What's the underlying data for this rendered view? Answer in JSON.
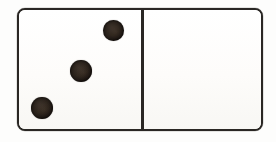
{
  "scene": {
    "width": 276,
    "height": 142,
    "background_color": "#fdfdfc",
    "subject": "domino-tile"
  },
  "domino": {
    "label": "domino tile",
    "outline_color": "#2a2724",
    "face_color": "#fefefd",
    "pip_color": "#1a1410",
    "border_width_px": 2.4,
    "corner_radius_px": 8,
    "bounds": {
      "x": 17,
      "y": 8,
      "width": 246,
      "height": 123
    },
    "divider": {
      "label": "center divider line",
      "x": 143,
      "width_px": 2.4,
      "color": "#2a2724"
    },
    "total_pips": 3,
    "notation": "3-0",
    "halves": [
      {
        "name": "left-half",
        "pip_count": 3,
        "pips": [
          {
            "name": "pip-top-right",
            "cx": 113.5,
            "cy": 30.5,
            "d": 21
          },
          {
            "name": "pip-middle",
            "cx": 81.0,
            "cy": 71.0,
            "d": 22
          },
          {
            "name": "pip-bottom-left",
            "cx": 42.0,
            "cy": 108.0,
            "d": 22
          }
        ]
      },
      {
        "name": "right-half",
        "pip_count": 0,
        "pips": []
      }
    ]
  },
  "chart_data": {
    "type": "bar",
    "categories": [
      "left-half",
      "right-half"
    ],
    "values": [
      3,
      0
    ],
    "xlabel": "half",
    "ylabel": "pips",
    "ylim": [
      0,
      6
    ]
  }
}
